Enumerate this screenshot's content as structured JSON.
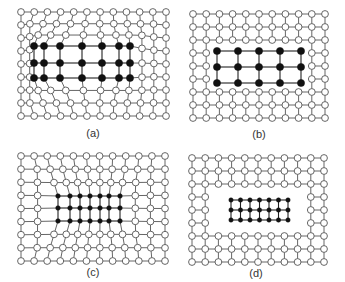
{
  "figure": {
    "width": 345,
    "height": 282,
    "colors": {
      "edge": "#555555",
      "open_fill": "#ffffff",
      "solid_fill": "#111111",
      "label": "#333333"
    },
    "panels": [
      {
        "id": "a",
        "label": "(a)",
        "label_pos": [
          93,
          133
        ],
        "description": "Deformed mesh with enlarged dense region (black nodes) bulging outward",
        "outer": {
          "cols": 12,
          "rows": 9,
          "x0": 21,
          "y0": 12,
          "x1": 166,
          "y1": 116
        },
        "inner": {
          "mode": "deform",
          "cols": 7,
          "rows": 3,
          "cx": 93,
          "cy": 66,
          "halfw": 66,
          "halfh": 22,
          "strength": 1.0,
          "xs": [
            34,
            44,
            60,
            82,
            102,
            119,
            130
          ],
          "ys": [
            46,
            63,
            78
          ]
        }
      },
      {
        "id": "b",
        "label": "(b)",
        "label_pos": [
          259,
          134
        ],
        "description": "Regular mesh with rectangular hole containing a coarse black-node grid",
        "outer": {
          "cols": 11,
          "rows": 9,
          "x0": 193,
          "y0": 14,
          "x1": 325,
          "y1": 118,
          "hole": {
            "c0": 2,
            "c1": 8,
            "r0": 3,
            "r1": 5
          }
        },
        "inner": {
          "mode": "grid",
          "cols": 5,
          "rows": 3,
          "x0": 217,
          "y0": 51,
          "x1": 301,
          "y1": 83
        }
      },
      {
        "id": "c",
        "label": "(c)",
        "label_pos": [
          93,
          272
        ],
        "description": "Deformed mesh with compressed dense region (black nodes) pulling inward",
        "outer": {
          "cols": 12,
          "rows": 9,
          "x0": 21,
          "y0": 156,
          "x1": 165,
          "y1": 261
        },
        "inner": {
          "mode": "deform",
          "cols": 7,
          "rows": 3,
          "cx": 89,
          "cy": 208,
          "halfw": 31,
          "halfh": 13,
          "strength": -1.0,
          "xs": [
            58,
            70,
            80,
            90,
            100,
            109,
            120
          ],
          "ys": [
            196,
            208,
            221
          ]
        }
      },
      {
        "id": "d",
        "label": "(d)",
        "label_pos": [
          256,
          273
        ],
        "description": "Regular mesh with rectangular hole containing a fine black-node grid",
        "outer": {
          "cols": 11,
          "rows": 9,
          "x0": 192,
          "y0": 158,
          "x1": 324,
          "y1": 262,
          "hole": {
            "c0": 2,
            "c1": 8,
            "r0": 3,
            "r1": 5
          }
        },
        "inner": {
          "mode": "grid",
          "cols": 7,
          "rows": 3,
          "x0": 231,
          "y0": 200,
          "x1": 288,
          "y1": 220
        }
      }
    ]
  }
}
